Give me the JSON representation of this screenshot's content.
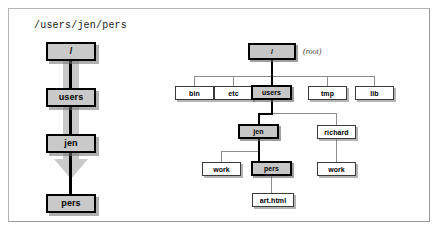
{
  "figure": {
    "caption": "/users/jen/pers",
    "root_note": "(root)"
  },
  "colors": {
    "selected_fill": "#c6c6c6",
    "node_fill": "#ffffff",
    "node_border": "#3a3a3a",
    "selected_border": "#000000",
    "edge": "#8c8c8c",
    "edge_highlight": "#000000",
    "arrow_fill": "#c9c9c9",
    "frame_border": "#9a9a9a",
    "background": "#ffffff"
  },
  "path_chain": {
    "title": "/users/jen/pers",
    "nodes": [
      {
        "label": "/",
        "selected": true
      },
      {
        "label": "users",
        "selected": true
      },
      {
        "label": "jen",
        "selected": true
      },
      {
        "label": "pers",
        "selected": true
      }
    ]
  },
  "tree": {
    "root_label": "/",
    "root_note": "(root)",
    "nodes": [
      {
        "id": "root",
        "label": "/",
        "selected": true,
        "level": 0
      },
      {
        "id": "bin",
        "label": "bin",
        "selected": false,
        "level": 1
      },
      {
        "id": "etc",
        "label": "etc",
        "selected": false,
        "level": 1
      },
      {
        "id": "users",
        "label": "users",
        "selected": true,
        "level": 1
      },
      {
        "id": "tmp",
        "label": "tmp",
        "selected": false,
        "level": 1
      },
      {
        "id": "lib",
        "label": "lib",
        "selected": false,
        "level": 1
      },
      {
        "id": "jen",
        "label": "jen",
        "selected": true,
        "level": 2
      },
      {
        "id": "richard",
        "label": "richard",
        "selected": false,
        "level": 2
      },
      {
        "id": "work_jen",
        "label": "work",
        "selected": false,
        "level": 3
      },
      {
        "id": "pers",
        "label": "pers",
        "selected": true,
        "level": 3
      },
      {
        "id": "work_rich",
        "label": "work",
        "selected": false,
        "level": 3
      },
      {
        "id": "arthtml",
        "label": "art.html",
        "selected": false,
        "level": 4
      }
    ],
    "edges": [
      {
        "from": "root",
        "to": "bin",
        "highlight": false
      },
      {
        "from": "root",
        "to": "etc",
        "highlight": false
      },
      {
        "from": "root",
        "to": "users",
        "highlight": true
      },
      {
        "from": "root",
        "to": "tmp",
        "highlight": false
      },
      {
        "from": "root",
        "to": "lib",
        "highlight": false
      },
      {
        "from": "users",
        "to": "jen",
        "highlight": true
      },
      {
        "from": "users",
        "to": "richard",
        "highlight": false
      },
      {
        "from": "jen",
        "to": "work_jen",
        "highlight": false
      },
      {
        "from": "jen",
        "to": "pers",
        "highlight": true
      },
      {
        "from": "richard",
        "to": "work_rich",
        "highlight": false
      },
      {
        "from": "pers",
        "to": "arthtml",
        "highlight": false
      }
    ]
  }
}
